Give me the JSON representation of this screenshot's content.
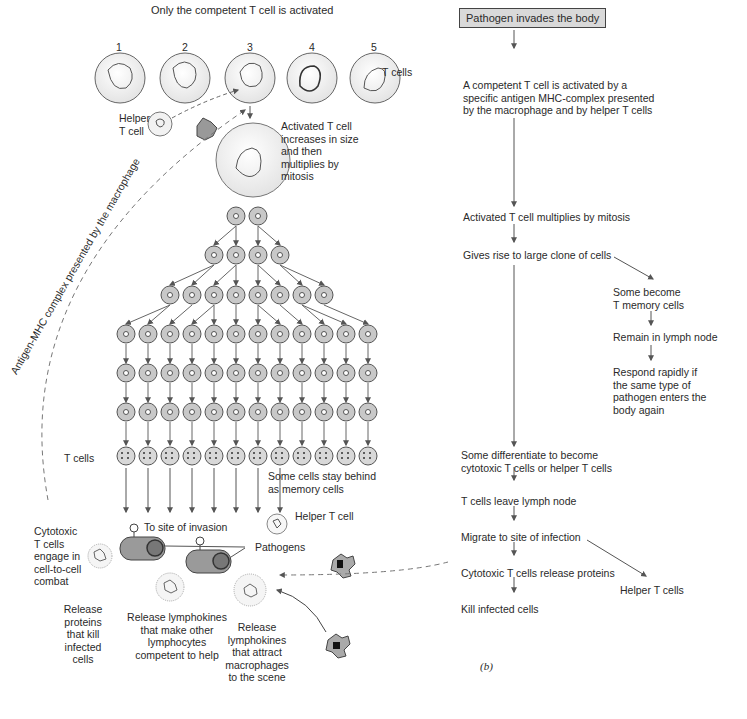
{
  "left_panel": {
    "title": "Only the competent T cell is activated",
    "cell_numbers": [
      "1",
      "2",
      "3",
      "4",
      "5"
    ],
    "t_cells_label": "T cells",
    "helper_label_line1": "Helper",
    "helper_label_line2": "T cell",
    "activated_text": [
      "Activated T cell",
      "increases in size",
      "and then",
      "multiplies by",
      "mitosis"
    ],
    "dashed_path_label": "Antigen-MHC complex presented by the macrophage",
    "clone_rows": [
      2,
      4,
      8,
      12,
      12,
      12
    ],
    "bottom_row_label": "T cells",
    "memory_text": [
      "Some cells stay behind",
      "as memory cells"
    ],
    "helper_t_cell_label": "Helper T cell",
    "to_site_label": "To site of invasion",
    "pathogens_label": "Pathogens",
    "cytotoxic_text": [
      "Cytotoxic",
      "T cells",
      "engage in",
      "cell-to-cell",
      "combat"
    ],
    "release_proteins": [
      "Release",
      "proteins",
      "that kill",
      "infected",
      "cells"
    ],
    "release_lymphokines_help": [
      "Release lymphokines",
      "that make other",
      "lymphocytes",
      "competent to help"
    ],
    "release_lymphokines_macro": [
      "Release",
      "lymphokines",
      "that attract",
      "macrophages",
      "to the scene"
    ]
  },
  "right_panel": {
    "start_box": "Pathogen invades the body",
    "step_activated": [
      "A competent T cell is activated by a",
      "specific antigen MHC-complex presented",
      "by the macrophage and by helper T cells"
    ],
    "step_multiplies": "Activated T cell multiplies by mitosis",
    "step_clone": "Gives rise to large clone of cells",
    "memory_branch": {
      "become": [
        "Some become",
        "T memory cells"
      ],
      "remain": "Remain in lymph node",
      "respond": [
        "Respond rapidly if",
        "the same type of",
        "pathogen enters the",
        "body again"
      ]
    },
    "step_differentiate": [
      "Some differentiate to become",
      "cytotoxic T cells or helper T cells"
    ],
    "step_leave": "T cells leave lymph node",
    "step_migrate": "Migrate to site of infection",
    "step_release": "Cytotoxic T cells release proteins",
    "step_kill": "Kill infected cells",
    "helper_branch": "Helper T cells",
    "panel_label": "(b)"
  },
  "colors": {
    "cell_fill": "#c8c8c8",
    "large_cell_fill": "#f2f2f2",
    "line": "#555555",
    "box_fill": "#d9d9d9"
  }
}
